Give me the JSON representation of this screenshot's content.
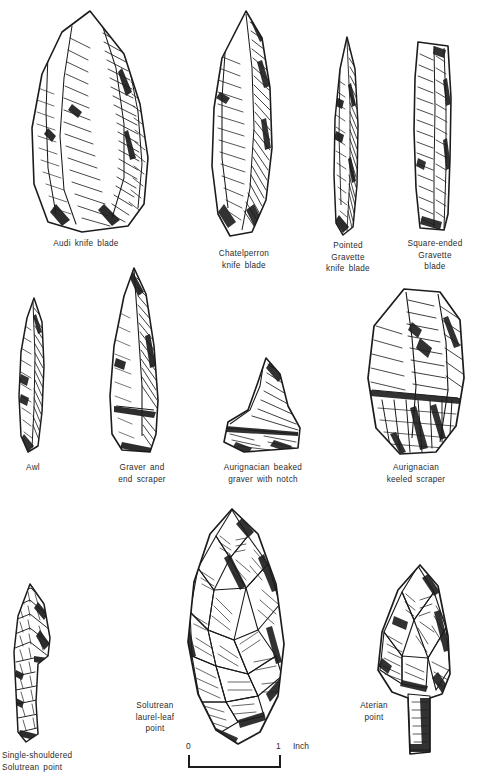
{
  "plate": {
    "title": "Upper Paleolithic stone tool types",
    "medium": "pen-and-ink line drawing plate",
    "background_color": "#ffffff",
    "ink_color": "#1c1c1c"
  },
  "tools": [
    {
      "id": "audi-knife-blade",
      "caption": "Audi knife blade",
      "row": 1,
      "shape": "broad pointed blade with steep retouched back"
    },
    {
      "id": "chatelperron-knife-blade",
      "caption": "Chatelperron\nknife blade",
      "row": 1,
      "shape": "curved-backed pointed blade"
    },
    {
      "id": "pointed-gravette-knife-blade",
      "caption": "Pointed\nGravette\nknife blade",
      "row": 1,
      "shape": "narrow elongated pointed bladelet"
    },
    {
      "id": "square-ended-gravette-blade",
      "caption": "Square-ended\nGravette\nblade",
      "row": 1,
      "shape": "narrow blade with squared truncation"
    },
    {
      "id": "awl",
      "caption": "Awl",
      "row": 2,
      "shape": "slender pointed borer"
    },
    {
      "id": "graver-and-end-scraper",
      "caption": "Graver   and\nend   scraper",
      "row": 2,
      "shape": "triangular blade with burin tip and scraper base"
    },
    {
      "id": "aurignacian-beaked-graver-with-notch",
      "caption": "Aurignacian   beaked\ngraver   with   notch",
      "row": 2,
      "shape": "beaked burin with lateral notch"
    },
    {
      "id": "aurignacian-keeled-scraper",
      "caption": "Aurignacian\nkeeled scraper",
      "row": 2,
      "shape": "thick carinated core scraper"
    },
    {
      "id": "single-shouldered-solutrean-point",
      "caption": "Single-shouldered\nSolutrean  point",
      "row": 3,
      "shape": "shouldered point with tang"
    },
    {
      "id": "solutrean-laurel-leaf-point",
      "caption": "Solutrean\nlaurel-leaf\npoint",
      "row": 3,
      "shape": "large bifacially flaked leaf-shaped point"
    },
    {
      "id": "aterian-point",
      "caption": "Aterian\npoint",
      "row": 3,
      "shape": "tanged point with basal stem"
    }
  ],
  "scale": {
    "start_label": "0",
    "end_label": "1",
    "unit_label": "Inch"
  }
}
